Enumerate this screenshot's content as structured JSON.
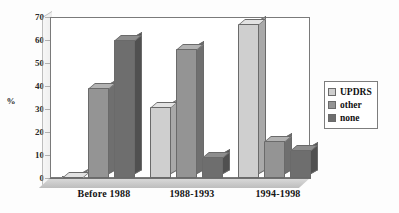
{
  "chart_data": {
    "type": "bar",
    "title": "",
    "subtitle": "",
    "xlabel": "",
    "ylabel": "%",
    "ylim": [
      0,
      70
    ],
    "yticks": [
      0,
      10,
      20,
      30,
      40,
      50,
      60,
      70
    ],
    "grid": false,
    "legend_position": "right",
    "categories": [
      "Before 1988",
      "1988-1993",
      "1994-1998"
    ],
    "series": [
      {
        "name": "UPDRS",
        "color": "#cfcfcf",
        "values": [
          0,
          31,
          67
        ]
      },
      {
        "name": "other",
        "color": "#949494",
        "values": [
          39,
          56,
          16
        ]
      },
      {
        "name": "none",
        "color": "#6e6e6e",
        "values": [
          60,
          9,
          12
        ]
      }
    ]
  },
  "axis": {
    "y_label": "%",
    "ticks": [
      "70",
      "60",
      "50",
      "40",
      "30",
      "20",
      "10",
      "0"
    ]
  },
  "x_categories": [
    {
      "label": "Before 1988"
    },
    {
      "label": "1988-1993"
    },
    {
      "label": "1994-1998"
    }
  ],
  "legend": {
    "entries": [
      {
        "label": "UPDRS"
      },
      {
        "label": "other"
      },
      {
        "label": "none"
      }
    ]
  }
}
